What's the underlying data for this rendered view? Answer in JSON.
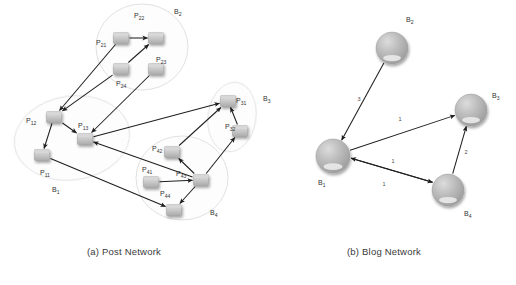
{
  "figure": {
    "captions": {
      "a": "(a) Post Network",
      "b": "(b) Blog Network"
    }
  },
  "post_network": {
    "clusters": [
      {
        "id": "B1",
        "label": "B",
        "sub": "1",
        "cx": 72,
        "cy": 138,
        "rx": 58,
        "ry": 42,
        "rot": -8,
        "label_x": 52,
        "label_y": 192
      },
      {
        "id": "B2",
        "label": "B",
        "sub": "2",
        "cx": 142,
        "cy": 47,
        "rx": 46,
        "ry": 43,
        "rot": 0,
        "label_x": 174,
        "label_y": 14
      },
      {
        "id": "B3",
        "label": "B",
        "sub": "3",
        "cx": 232,
        "cy": 117,
        "rx": 24,
        "ry": 35,
        "rot": 8,
        "label_x": 263,
        "label_y": 101
      },
      {
        "id": "B4",
        "label": "B",
        "sub": "4",
        "cx": 182,
        "cy": 178,
        "rx": 46,
        "ry": 42,
        "rot": 0,
        "label_x": 210,
        "label_y": 215
      }
    ],
    "nodes": [
      {
        "id": "P11",
        "label": "P",
        "sub": "11",
        "x": 42,
        "y": 155,
        "label_x": 40,
        "label_y": 175,
        "anchor": "start"
      },
      {
        "id": "P12",
        "label": "P",
        "sub": "12",
        "x": 54,
        "y": 117,
        "label_x": 26,
        "label_y": 123,
        "anchor": "start"
      },
      {
        "id": "P13",
        "label": "P",
        "sub": "13",
        "x": 85,
        "y": 139,
        "label_x": 78,
        "label_y": 128,
        "anchor": "start"
      },
      {
        "id": "P21",
        "label": "P",
        "sub": "21",
        "x": 121,
        "y": 38,
        "label_x": 96,
        "label_y": 45,
        "anchor": "start"
      },
      {
        "id": "P22",
        "label": "P",
        "sub": "22",
        "x": 156,
        "y": 38,
        "label_x": 134,
        "label_y": 18,
        "anchor": "start"
      },
      {
        "id": "P24",
        "label": "P",
        "sub": "24",
        "x": 121,
        "y": 69,
        "label_x": 116,
        "label_y": 86,
        "anchor": "start"
      },
      {
        "id": "P23",
        "label": "P",
        "sub": "23",
        "x": 156,
        "y": 69,
        "label_x": 156,
        "label_y": 62,
        "anchor": "start"
      },
      {
        "id": "P31",
        "label": "P",
        "sub": "31",
        "x": 228,
        "y": 101,
        "label_x": 236,
        "label_y": 103,
        "anchor": "start"
      },
      {
        "id": "P32",
        "label": "P",
        "sub": "32",
        "x": 240,
        "y": 131,
        "label_x": 225,
        "label_y": 129,
        "anchor": "start"
      },
      {
        "id": "P41",
        "label": "P",
        "sub": "41",
        "x": 151,
        "y": 182,
        "label_x": 142,
        "label_y": 172,
        "anchor": "start"
      },
      {
        "id": "P42",
        "label": "P",
        "sub": "42",
        "x": 172,
        "y": 152,
        "label_x": 152,
        "label_y": 151,
        "anchor": "start"
      },
      {
        "id": "P43",
        "label": "P",
        "sub": "43",
        "x": 201,
        "y": 180,
        "label_x": 176,
        "label_y": 176,
        "anchor": "start"
      },
      {
        "id": "P44",
        "label": "P",
        "sub": "44",
        "x": 174,
        "y": 210,
        "label_x": 160,
        "label_y": 196,
        "anchor": "start"
      }
    ],
    "edges": [
      {
        "from": "P21",
        "to": "P12"
      },
      {
        "from": "P21",
        "to": "P22"
      },
      {
        "from": "P24",
        "to": "P22"
      },
      {
        "from": "P24",
        "to": "P12"
      },
      {
        "from": "P23",
        "to": "P13"
      },
      {
        "from": "P12",
        "to": "P13"
      },
      {
        "from": "P12",
        "to": "P11"
      },
      {
        "from": "P13",
        "to": "P31"
      },
      {
        "from": "P11",
        "to": "P44"
      },
      {
        "from": "P42",
        "to": "P31"
      },
      {
        "from": "P43",
        "to": "P42"
      },
      {
        "from": "P43",
        "to": "P13"
      },
      {
        "from": "P43",
        "to": "P44"
      },
      {
        "from": "P43",
        "to": "P32"
      },
      {
        "from": "P41",
        "to": "P43"
      },
      {
        "from": "P32",
        "to": "P31"
      }
    ]
  },
  "blog_network": {
    "nodes": [
      {
        "id": "B1",
        "label": "B",
        "sub": "1",
        "x": 333,
        "y": 156,
        "r": 17,
        "label_x": 318,
        "label_y": 185,
        "anchor": "start"
      },
      {
        "id": "B2",
        "label": "B",
        "sub": "2",
        "x": 392,
        "y": 48,
        "r": 16,
        "label_x": 406,
        "label_y": 22,
        "anchor": "start"
      },
      {
        "id": "B3",
        "label": "B",
        "sub": "3",
        "x": 471,
        "y": 110,
        "r": 16,
        "label_x": 492,
        "label_y": 98,
        "anchor": "start"
      },
      {
        "id": "B4",
        "label": "B",
        "sub": "4",
        "x": 448,
        "y": 190,
        "r": 16,
        "label_x": 464,
        "label_y": 216,
        "anchor": "start"
      }
    ],
    "edges": [
      {
        "from": "B2",
        "to": "B1",
        "weight": "3",
        "label_x": 359,
        "label_y": 101,
        "curve": 0
      },
      {
        "from": "B1",
        "to": "B3",
        "weight": "1",
        "label_x": 400,
        "label_y": 121,
        "curve": 0
      },
      {
        "from": "B1",
        "to": "B4",
        "weight": "1",
        "label_x": 393,
        "label_y": 163,
        "curve": 0,
        "offset": -3
      },
      {
        "from": "B4",
        "to": "B1",
        "weight": "1",
        "label_x": 384,
        "label_y": 186,
        "curve": 0,
        "offset": 3
      },
      {
        "from": "B4",
        "to": "B3",
        "weight": "2",
        "label_x": 466,
        "label_y": 154,
        "curve": 0
      }
    ]
  }
}
